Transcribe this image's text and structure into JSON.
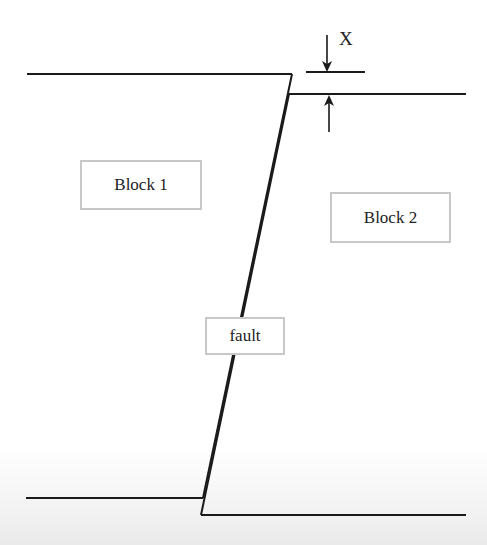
{
  "diagram": {
    "type": "normal-fault-cross-section",
    "labels": {
      "block1": "Block 1",
      "block2": "Block 2",
      "fault": "fault",
      "offset": "X"
    },
    "elements": {
      "surface_left": "upper surface of Block 1",
      "surface_right": "upper surface of Block 2 (downthrown)",
      "base_left": "lower boundary of Block 1",
      "base_right": "lower boundary of Block 2",
      "fault_plane": "inclined fault plane (double line)",
      "offset_indicator": "vertical displacement X between the two surfaces"
    },
    "colors": {
      "line": "#1a1a1a",
      "box_border": "#c8c8c8",
      "text": "#222222"
    }
  }
}
